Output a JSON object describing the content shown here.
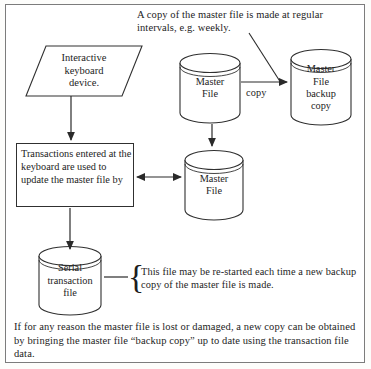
{
  "figure": {
    "border_color": "#7c7c7c",
    "ink_color": "#1d1d1d"
  },
  "captions": {
    "top": "A copy of the master file is made at regular intervals, e.g. weekly.",
    "brace_note": "This file may be re-started each time a new backup copy of the master file is made.",
    "bottom": "If for any reason the master file is lost or damaged, a new copy can be obtained by bringing the master file “backup copy” up to date using the transaction file data."
  },
  "nodes": {
    "input_device": {
      "shape": "parallelogram",
      "label": "Interactive\nkeyboard\ndevice."
    },
    "process": {
      "shape": "rectangle",
      "label": "Transactions entered at the keyboard are used to update the master file by"
    },
    "master_file_top": {
      "shape": "cylinder",
      "label": "Master\nFile"
    },
    "master_file_backup": {
      "shape": "cylinder",
      "label": "Master\nFile\nbackup\ncopy"
    },
    "master_file_middle": {
      "shape": "cylinder",
      "label": "Master\nFile"
    },
    "serial_transaction_file": {
      "shape": "cylinder",
      "label": "Serial\ntransaction\nfile"
    }
  },
  "edges": {
    "copy_label": "copy"
  }
}
